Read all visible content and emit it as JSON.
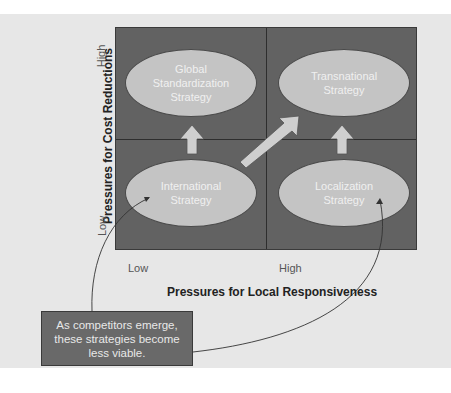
{
  "diagram": {
    "y_axis": {
      "title": "Pressures for Cost Reductions",
      "high_label": "High",
      "low_label": "Low"
    },
    "x_axis": {
      "title": "Pressures for Local Responsiveness",
      "low_label": "Low",
      "high_label": "High"
    },
    "quadrants": {
      "top_left": "Global\nStandardization\nStrategy",
      "top_right": "Transnational\nStrategy",
      "bottom_left": "International\nStrategy",
      "bottom_right": "Localization\nStrategy"
    },
    "note": "As competitors emerge,\nthese strategies become\nless viable.",
    "colors": {
      "background": "#e7e7e7",
      "grid": "#626262",
      "ellipse": "#c4c4c4",
      "arrow": "#cfcfcf",
      "note": "#696969"
    }
  }
}
